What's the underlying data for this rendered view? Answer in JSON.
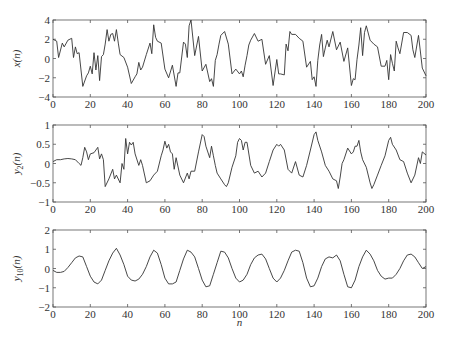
{
  "chart_data": [
    {
      "type": "line",
      "title": "",
      "xlabel": "",
      "ylabel": "x(n)",
      "xlim": [
        0,
        200
      ],
      "ylim": [
        -4,
        4
      ],
      "xticks": [
        0,
        20,
        40,
        60,
        80,
        100,
        120,
        140,
        160,
        180,
        200
      ],
      "yticks": [
        -4,
        -2,
        0,
        2,
        4
      ],
      "grid": false,
      "x": [
        0,
        2,
        3,
        5,
        6,
        8,
        10,
        11,
        12,
        13,
        14,
        16,
        18,
        19,
        20,
        21,
        22,
        23,
        24,
        25,
        26,
        27,
        28,
        29,
        30,
        31,
        32,
        33,
        34,
        35,
        36,
        38,
        40,
        42,
        44,
        45,
        46,
        47,
        48,
        50,
        52,
        53,
        54,
        55,
        56,
        58,
        60,
        62,
        64,
        66,
        67,
        68,
        70,
        71,
        72,
        73,
        74,
        76,
        78,
        80,
        82,
        84,
        85,
        86,
        87,
        88,
        89,
        90,
        92,
        94,
        96,
        98,
        100,
        101,
        102,
        103,
        104,
        105,
        106,
        108,
        110,
        112,
        114,
        116,
        118,
        120,
        121,
        122,
        124,
        125,
        126,
        127,
        128,
        130,
        132,
        134,
        136,
        138,
        139,
        140,
        141,
        142,
        143,
        144,
        145,
        146,
        147,
        148,
        150,
        152,
        154,
        156,
        158,
        160,
        161,
        162,
        163,
        164,
        165,
        166,
        167,
        168,
        170,
        172,
        174,
        176,
        178,
        179,
        180,
        181,
        182,
        183,
        184,
        185,
        186,
        188,
        190,
        192,
        193,
        194,
        196,
        198,
        200
      ],
      "values": [
        2.0,
        1.8,
        0.1,
        1.6,
        1.2,
        1.9,
        2.1,
        0.1,
        1.2,
        0.5,
        0.6,
        -2.9,
        -1.8,
        -1.5,
        -0.8,
        -1.6,
        0.6,
        -1.2,
        0.3,
        -2.3,
        0.2,
        0.4,
        1.5,
        3.0,
        1.8,
        2.5,
        2.6,
        1.8,
        3.0,
        1.6,
        0.4,
        0.1,
        -0.9,
        -2.6,
        -1.9,
        -1.6,
        -0.4,
        -1.2,
        -0.9,
        0.4,
        1.6,
        0.5,
        3.5,
        2.2,
        1.8,
        1.6,
        -1.1,
        -2.0,
        -0.7,
        -2.9,
        -1.5,
        -1.5,
        1.7,
        1.5,
        0.1,
        3.4,
        4.0,
        0.3,
        2.3,
        -1.3,
        -0.6,
        -2.4,
        -2.1,
        -2.9,
        -0.2,
        0.4,
        1.5,
        2.4,
        2.8,
        1.5,
        -1.6,
        -1.1,
        -1.6,
        -1.3,
        -1.9,
        -0.7,
        0.3,
        1.4,
        1.9,
        2.6,
        1.8,
        2.0,
        -0.6,
        0.3,
        -2.8,
        -0.1,
        -1.6,
        -1.6,
        -1.7,
        1.5,
        0.8,
        2.8,
        2.5,
        2.5,
        2.1,
        1.8,
        -0.9,
        -0.3,
        -2.2,
        -1.9,
        -2.9,
        -0.2,
        1.4,
        2.5,
        0.2,
        1.1,
        1.9,
        1.2,
        2.8,
        0.9,
        1.7,
        -0.3,
        1.1,
        -2.8,
        -2.1,
        -2.2,
        -0.1,
        1.4,
        3.2,
        0.3,
        2.7,
        3.4,
        1.9,
        1.5,
        1.2,
        -0.8,
        -0.8,
        -0.2,
        -2.2,
        0.4,
        -0.5,
        -1.3,
        1.8,
        1.1,
        0.5,
        2.7,
        2.7,
        2.4,
        0.9,
        0.1,
        2.4,
        -1.0,
        -1.8,
        -1.9,
        0.3
      ],
      "series_name": "x(n)"
    },
    {
      "type": "line",
      "title": "",
      "xlabel": "",
      "ylabel": "y_2(n)",
      "xlim": [
        0,
        200
      ],
      "ylim": [
        -1,
        1
      ],
      "xticks": [
        0,
        20,
        40,
        60,
        80,
        100,
        120,
        140,
        160,
        180,
        200
      ],
      "yticks": [
        -1,
        -0.5,
        0,
        0.5,
        1
      ],
      "grid": false,
      "x": [
        0,
        2,
        4,
        6,
        8,
        10,
        12,
        14,
        15,
        16,
        17,
        18,
        19,
        20,
        22,
        24,
        25,
        26,
        27,
        28,
        30,
        32,
        33,
        34,
        36,
        37,
        38,
        39,
        40,
        41,
        42,
        43,
        44,
        46,
        47,
        48,
        50,
        52,
        54,
        56,
        58,
        59,
        60,
        61,
        62,
        63,
        64,
        65,
        66,
        68,
        70,
        72,
        73,
        74,
        76,
        78,
        80,
        81,
        82,
        84,
        85,
        86,
        87,
        88,
        90,
        92,
        93,
        94,
        96,
        98,
        99,
        100,
        101,
        102,
        103,
        104,
        106,
        108,
        110,
        112,
        114,
        116,
        118,
        120,
        121,
        122,
        124,
        126,
        128,
        130,
        132,
        134,
        136,
        138,
        140,
        141,
        142,
        144,
        146,
        148,
        150,
        152,
        153,
        154,
        155,
        156,
        158,
        160,
        161,
        162,
        163,
        164,
        165,
        166,
        168,
        170,
        171,
        172,
        174,
        176,
        178,
        180,
        181,
        182,
        184,
        186,
        188,
        190,
        192,
        194,
        196,
        197,
        198,
        200
      ],
      "values": [
        0.05,
        0.1,
        0.1,
        0.12,
        0.13,
        0.12,
        0.1,
        0.0,
        -0.05,
        0.15,
        0.42,
        0.3,
        0.1,
        0.25,
        0.28,
        0.42,
        0.12,
        0.25,
        0.1,
        -0.6,
        -0.4,
        -0.15,
        -0.4,
        -0.3,
        -0.5,
        0.0,
        -0.15,
        0.65,
        0.25,
        0.55,
        0.48,
        0.55,
        0.25,
        -0.05,
        0.1,
        -0.05,
        -0.5,
        -0.45,
        -0.3,
        -0.2,
        0.2,
        0.35,
        0.58,
        0.4,
        0.5,
        0.3,
        0.25,
        -0.15,
        0.15,
        -0.3,
        -0.5,
        -0.25,
        -0.4,
        -0.2,
        -0.2,
        0.3,
        0.75,
        0.7,
        0.45,
        0.15,
        0.45,
        0.2,
        -0.05,
        -0.25,
        -0.4,
        -0.55,
        -0.6,
        -0.5,
        -0.1,
        0.2,
        0.55,
        0.65,
        0.6,
        0.35,
        0.55,
        0.55,
        -0.05,
        -0.25,
        -0.2,
        -0.35,
        -0.25,
        0.05,
        0.35,
        0.5,
        0.45,
        0.5,
        0.35,
        -0.15,
        -0.25,
        0.05,
        -0.3,
        -0.35,
        -0.05,
        0.35,
        0.75,
        0.82,
        0.6,
        0.3,
        -0.05,
        -0.2,
        -0.4,
        -0.45,
        -0.65,
        -0.35,
        0.0,
        0.1,
        0.4,
        0.25,
        0.3,
        0.45,
        0.45,
        0.6,
        0.3,
        0.1,
        -0.1,
        -0.5,
        -0.65,
        -0.55,
        -0.3,
        -0.05,
        0.2,
        0.6,
        0.68,
        0.5,
        0.35,
        0.1,
        0.05,
        -0.25,
        -0.5,
        -0.3,
        0.15,
        0.0,
        0.3,
        0.22
      ],
      "series_name": "y_2(n)"
    },
    {
      "type": "line",
      "title": "",
      "xlabel": "n",
      "ylabel": "y_10(n)",
      "xlim": [
        0,
        200
      ],
      "ylim": [
        -2,
        2
      ],
      "xticks": [
        0,
        20,
        40,
        60,
        80,
        100,
        120,
        140,
        160,
        180,
        200
      ],
      "yticks": [
        -2,
        -1,
        0,
        1,
        2
      ],
      "grid": false,
      "x": [
        0,
        2,
        4,
        6,
        8,
        10,
        12,
        14,
        16,
        18,
        20,
        22,
        24,
        26,
        28,
        30,
        32,
        34,
        36,
        38,
        40,
        42,
        44,
        46,
        48,
        50,
        52,
        54,
        56,
        58,
        60,
        62,
        64,
        66,
        68,
        70,
        72,
        74,
        76,
        78,
        80,
        82,
        84,
        86,
        88,
        90,
        92,
        94,
        96,
        98,
        100,
        102,
        104,
        106,
        108,
        110,
        112,
        114,
        116,
        118,
        120,
        122,
        124,
        126,
        128,
        130,
        132,
        134,
        136,
        138,
        140,
        142,
        144,
        146,
        148,
        150,
        152,
        154,
        156,
        158,
        160,
        162,
        164,
        166,
        168,
        170,
        172,
        174,
        176,
        178,
        180,
        182,
        184,
        186,
        188,
        190,
        192,
        194,
        196,
        198,
        200
      ],
      "values": [
        -0.1,
        -0.2,
        -0.2,
        -0.15,
        0.05,
        0.3,
        0.55,
        0.65,
        0.6,
        0.1,
        -0.4,
        -0.7,
        -0.8,
        -0.6,
        -0.1,
        0.4,
        0.8,
        1.05,
        0.7,
        0.2,
        -0.4,
        -0.6,
        -0.65,
        -0.55,
        -0.3,
        0.1,
        0.6,
        0.95,
        0.8,
        0.2,
        -0.5,
        -0.8,
        -0.8,
        -0.7,
        -0.1,
        0.5,
        0.95,
        0.85,
        0.6,
        0.0,
        -0.6,
        -0.95,
        -0.9,
        -0.3,
        0.3,
        0.9,
        0.85,
        0.55,
        0.0,
        -0.5,
        -0.7,
        -0.6,
        -0.3,
        0.2,
        0.55,
        0.7,
        0.75,
        0.5,
        0.0,
        -0.5,
        -0.7,
        -0.5,
        -0.1,
        0.4,
        0.85,
        0.95,
        0.9,
        0.3,
        -0.5,
        -0.95,
        -0.9,
        -0.5,
        0.1,
        0.5,
        0.6,
        0.55,
        0.7,
        0.4,
        -0.3,
        -0.95,
        -1.0,
        -0.6,
        0.1,
        0.6,
        0.95,
        0.75,
        0.4,
        -0.1,
        -0.4,
        -0.55,
        -0.5,
        -0.5,
        -0.3,
        0.0,
        0.4,
        0.7,
        0.75,
        0.6,
        0.3,
        0.0,
        0.1
      ],
      "series_name": "y_10(n)"
    }
  ],
  "panels": [
    {
      "ylabel_main": "x",
      "ylabel_sub": "",
      "ylabel_arg": "(n)"
    },
    {
      "ylabel_main": "y",
      "ylabel_sub": "2",
      "ylabel_arg": "(n)"
    },
    {
      "ylabel_main": "y",
      "ylabel_sub": "10",
      "ylabel_arg": "(n)"
    }
  ],
  "xlabel": "n"
}
